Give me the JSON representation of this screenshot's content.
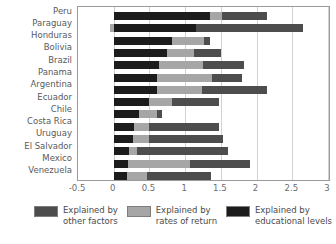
{
  "chart_data": {
    "type": "bar",
    "orientation": "horizontal",
    "stacked": true,
    "title": "",
    "xlabel": "",
    "ylabel": "",
    "xlim": [
      -0.5,
      3
    ],
    "xticks": [
      "-0.5",
      "0",
      "0.5",
      "1",
      "1.5",
      "2",
      "2.5",
      "3"
    ],
    "xtick_values": [
      -0.5,
      0,
      0.5,
      1,
      1.5,
      2,
      2.5,
      3
    ],
    "grid": true,
    "legend_position": "bottom",
    "categories": [
      "Peru",
      "Paraguay",
      "Honduras",
      "Bolivia",
      "Brazil",
      "Panama",
      "Argentina",
      "Ecuador",
      "Chile",
      "Costa Rica",
      "Uruguay",
      "El Salvador",
      "Mexico",
      "Venezuela"
    ],
    "series": [
      {
        "name": "Explained by educational levels",
        "key": "edu",
        "color": "#1c1c1c",
        "values": [
          1.35,
          1.15,
          0.82,
          0.75,
          0.63,
          0.6,
          0.6,
          0.5,
          0.35,
          0.28,
          0.27,
          0.22,
          0.2,
          0.18
        ]
      },
      {
        "name": "Explained by rates of return",
        "key": "ror",
        "color": "#a6a6a6",
        "values": [
          0.17,
          -0.05,
          0.45,
          0.37,
          0.62,
          0.78,
          0.63,
          0.32,
          0.25,
          0.22,
          0.22,
          0.1,
          0.87,
          0.28
        ]
      },
      {
        "name": "Explained by other factors",
        "key": "oth",
        "color": "#4d4d4d",
        "values": [
          0.63,
          1.5,
          0.08,
          0.38,
          0.57,
          0.41,
          0.92,
          0.65,
          0.08,
          0.97,
          1.04,
          1.28,
          0.84,
          0.9
        ]
      }
    ],
    "totals": [
      2.15,
      2.65,
      1.35,
      1.5,
      1.82,
      1.79,
      2.15,
      1.47,
      0.68,
      1.47,
      1.53,
      1.6,
      1.91,
      1.36
    ]
  },
  "legend": {
    "items": [
      {
        "label_line1": "Explained by",
        "label_line2": "other factors",
        "swatch": "sw-oth"
      },
      {
        "label_line1": "Explained by",
        "label_line2": "rates of return",
        "swatch": "sw-ror"
      },
      {
        "label_line1": "Explained by",
        "label_line2": "educational levels",
        "swatch": "sw-edu"
      }
    ]
  }
}
